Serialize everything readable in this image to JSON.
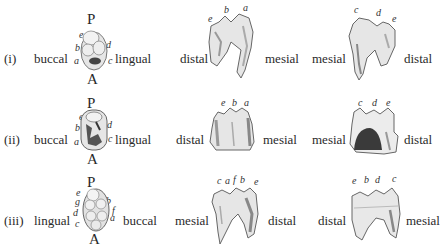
{
  "figure": {
    "rows": [
      {
        "numeral": "(i)",
        "occlusal": {
          "left_side": "buccal",
          "right_side": "lingual",
          "top": "P",
          "bottom": "A",
          "cusps_left": [
            "e",
            "b",
            "a"
          ],
          "cusps_right": [
            "d",
            "c"
          ]
        },
        "view2": {
          "left": "distal",
          "right": "mesial",
          "cusps": [
            "e",
            "b",
            "a"
          ]
        },
        "view3": {
          "left": "mesial",
          "right": "distal",
          "cusps": [
            "c",
            "d",
            "e"
          ]
        }
      },
      {
        "numeral": "(ii)",
        "occlusal": {
          "left_side": "buccal",
          "right_side": "lingual",
          "top": "P",
          "bottom": "A",
          "cusps_left": [
            "e",
            "b",
            "a"
          ],
          "cusps_right": [
            "d",
            "c"
          ]
        },
        "view2": {
          "left": "distal",
          "right": "mesial",
          "cusps": [
            "e",
            "b",
            "a"
          ]
        },
        "view3": {
          "left": "mesial",
          "right": "distal",
          "cusps": [
            "c",
            "d",
            "e"
          ]
        }
      },
      {
        "numeral": "(iii)",
        "occlusal": {
          "left_side": "lingual",
          "right_side": "buccal",
          "top": "P",
          "bottom": "A",
          "cusps_left": [
            "e",
            "g",
            "d",
            "c"
          ],
          "cusps_right": [
            "b",
            "f",
            "a"
          ]
        },
        "view2": {
          "left": "mesial",
          "right": "distal",
          "cusps": [
            "c",
            "a",
            "f",
            "b",
            "e"
          ]
        },
        "view3": {
          "left": "distal",
          "right": "mesial",
          "cusps": [
            "e",
            "b",
            "d",
            "c"
          ]
        }
      }
    ]
  },
  "colors": {
    "text": "#2a2a2a",
    "tooth_fill": "#e6e6e6",
    "tooth_shade": "#9a9a9a",
    "tooth_outline": "#555555"
  }
}
